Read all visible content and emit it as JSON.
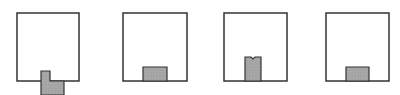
{
  "diagram": {
    "colors": {
      "outline": "#333333",
      "fill": "#a8a8a8",
      "background": "#ffffff"
    },
    "panels": [
      {
        "id": "panel-1",
        "box": {
          "x": 17,
          "y": 13,
          "w": 62,
          "h": 68
        },
        "shape": "L-shape extending below the bottom edge",
        "points": "41,71 50,71 50,81 64,81 64,95 41,95"
      },
      {
        "id": "panel-2",
        "box": {
          "x": 123,
          "y": 13,
          "w": 64,
          "h": 68
        },
        "shape": "wide short rectangle on bottom edge",
        "points": "143,67 167,67 167,81 143,81"
      },
      {
        "id": "panel-3",
        "box": {
          "x": 224,
          "y": 13,
          "w": 63,
          "h": 68
        },
        "shape": "narrow tall rectangle on bottom edge with top notch",
        "points": "245,57 251,57 253,59 255,57 261,57 261,81 245,81"
      },
      {
        "id": "panel-4",
        "box": {
          "x": 326,
          "y": 13,
          "w": 63,
          "h": 68
        },
        "shape": "wide short rectangle on bottom edge",
        "points": "346,67 369,67 369,81 346,81"
      }
    ]
  }
}
